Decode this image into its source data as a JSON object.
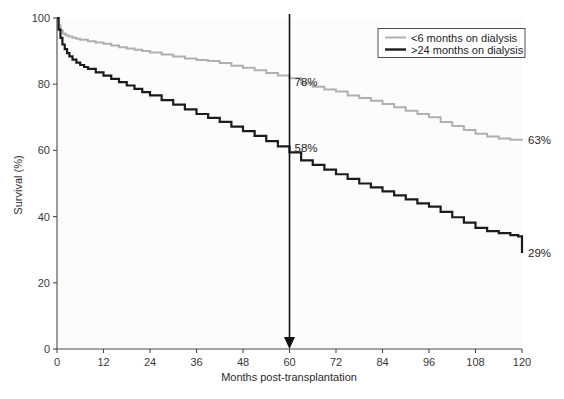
{
  "chart_data": {
    "type": "line",
    "title": "",
    "xlabel": "Months post-transplantation",
    "ylabel": "Survival (%)",
    "xlim": [
      0,
      120
    ],
    "ylim": [
      0,
      100
    ],
    "xticks": [
      0,
      12,
      24,
      36,
      48,
      60,
      72,
      84,
      96,
      108,
      120
    ],
    "yticks": [
      0,
      20,
      40,
      60,
      80,
      100
    ],
    "xtick_labels": [
      "0",
      "12",
      "24",
      "36",
      "48",
      "60",
      "72",
      "84",
      "96",
      "108",
      "120"
    ],
    "ytick_labels": [
      "0",
      "20",
      "40",
      "60",
      "80",
      "100"
    ],
    "grid": false,
    "legend_position": "top-right",
    "series": [
      {
        "name": "<6 months on dialysis",
        "color": "#b0b0b0",
        "stroke_width": 2.0,
        "x": [
          0,
          0.4,
          0.9,
          1.5,
          2.2,
          3,
          4,
          5,
          6,
          8,
          10,
          12,
          14,
          16,
          18,
          20,
          22,
          24,
          27,
          30,
          33,
          36,
          39,
          42,
          45,
          48,
          51,
          54,
          57,
          60,
          63,
          66,
          69,
          72,
          75,
          78,
          81,
          84,
          87,
          90,
          93,
          96,
          99,
          102,
          105,
          108,
          111,
          114,
          117,
          120
        ],
        "y": [
          100,
          97.8,
          96.2,
          95.3,
          94.8,
          94.4,
          94.0,
          93.7,
          93.4,
          93.0,
          92.6,
          92.2,
          91.7,
          91.2,
          90.8,
          90.4,
          90.0,
          89.6,
          89.0,
          88.4,
          87.8,
          87.3,
          87.0,
          86.4,
          85.6,
          85.0,
          84.2,
          83.4,
          82.6,
          81.8,
          80.2,
          79.2,
          78.4,
          77.8,
          76.6,
          75.8,
          75.0,
          74.0,
          73.0,
          72.0,
          71.0,
          70.0,
          68.6,
          67.4,
          66.2,
          65.0,
          64.2,
          63.6,
          63.2,
          63.0
        ]
      },
      {
        "name": ">24 months on dialysis",
        "color": "#1b1b1b",
        "stroke_width": 2.2,
        "x": [
          0,
          0.4,
          0.9,
          1.4,
          2.0,
          2.6,
          3.2,
          4,
          5,
          6,
          7,
          8,
          10,
          12,
          14,
          16,
          18,
          20,
          22,
          24,
          27,
          30,
          33,
          36,
          39,
          42,
          45,
          48,
          51,
          54,
          57,
          60,
          63,
          66,
          69,
          72,
          75,
          78,
          81,
          84,
          87,
          90,
          93,
          96,
          99,
          102,
          105,
          108,
          111,
          114,
          117,
          119,
          120
        ],
        "y": [
          100,
          96.5,
          94.0,
          92.0,
          90.6,
          89.4,
          88.4,
          87.4,
          86.5,
          85.8,
          85.2,
          84.6,
          83.6,
          82.6,
          81.6,
          80.6,
          79.6,
          78.6,
          77.6,
          76.6,
          75.2,
          73.8,
          72.4,
          71.0,
          69.8,
          68.6,
          67.2,
          65.8,
          64.4,
          62.8,
          61.2,
          59.4,
          57.0,
          55.6,
          54.2,
          52.8,
          51.4,
          50.0,
          48.8,
          47.6,
          46.4,
          45.2,
          44.0,
          43.0,
          41.4,
          39.8,
          38.2,
          36.6,
          35.6,
          35.0,
          34.4,
          34.0,
          29.0
        ]
      }
    ],
    "annotations": [
      {
        "name": "gray-at-60",
        "text": "78%",
        "x": 60,
        "y": 78,
        "anchor": "left-above"
      },
      {
        "name": "black-at-60",
        "text": "58%",
        "x": 60,
        "y": 58,
        "anchor": "left-above"
      },
      {
        "name": "gray-endpoint",
        "text": "63%",
        "x": 120,
        "y": 63,
        "anchor": "right"
      },
      {
        "name": "black-endpoint",
        "text": "29%",
        "x": 120,
        "y": 29,
        "anchor": "right"
      }
    ],
    "marker": {
      "name": "month-60-arrow",
      "x": 60,
      "type": "vertical-arrow-down",
      "color": "#111111"
    }
  },
  "legend": {
    "entries": [
      {
        "label": "<6 months on dialysis",
        "color": "#b0b0b0"
      },
      {
        "label": ">24 months on dialysis",
        "color": "#1b1b1b"
      }
    ]
  },
  "colors": {
    "series_light": "#b0b0b0",
    "series_dark": "#1b1b1b",
    "axis": "#4a4a4a",
    "text": "#262626",
    "background": "#ffffff"
  }
}
